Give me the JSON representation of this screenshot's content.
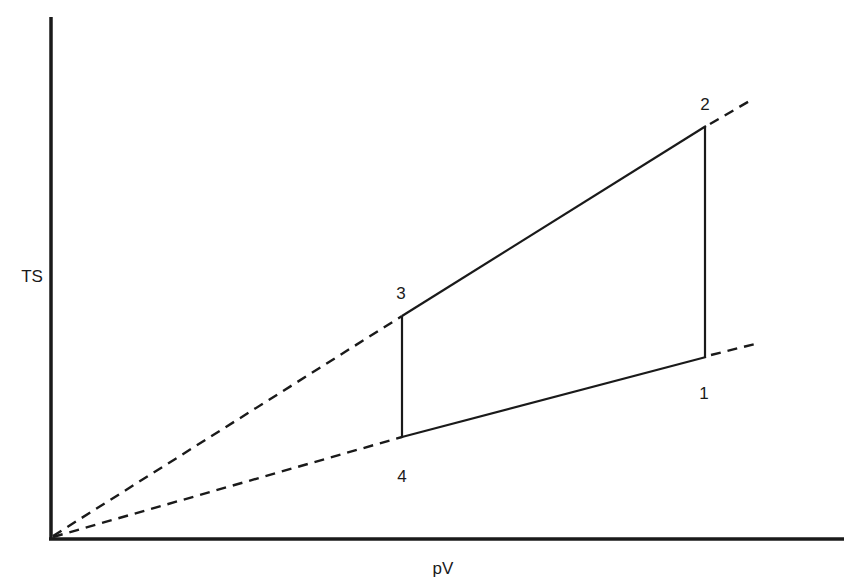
{
  "diagram": {
    "title": "",
    "axes": {
      "x_label": "pV",
      "y_label": "TS"
    },
    "points": [
      {
        "id": "1",
        "label": "1"
      },
      {
        "id": "2",
        "label": "2"
      },
      {
        "id": "3",
        "label": "3"
      },
      {
        "id": "4",
        "label": "4"
      }
    ],
    "cycle_edges": [
      {
        "from": "1",
        "to": "2",
        "style": "solid"
      },
      {
        "from": "2",
        "to": "3",
        "style": "solid"
      },
      {
        "from": "3",
        "to": "4",
        "style": "solid"
      },
      {
        "from": "4",
        "to": "1",
        "style": "solid"
      }
    ],
    "extension_lines": [
      {
        "through": [
          "origin",
          "3",
          "2"
        ],
        "style": "dashed"
      },
      {
        "through": [
          "origin",
          "4",
          "1"
        ],
        "style": "dashed"
      }
    ],
    "colors": {
      "line": "#1a1a1a",
      "background": "#ffffff"
    }
  }
}
